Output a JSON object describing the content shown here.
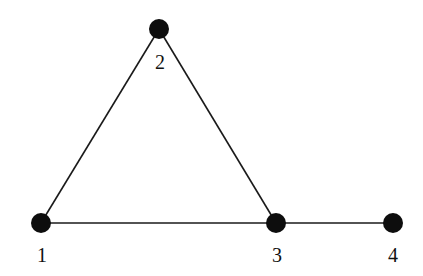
{
  "graph": {
    "nodes": [
      {
        "id": "1",
        "label": "1",
        "x": 41,
        "y": 223,
        "lx": 42,
        "ly": 262
      },
      {
        "id": "2",
        "label": "2",
        "x": 159,
        "y": 29,
        "lx": 160,
        "ly": 69
      },
      {
        "id": "3",
        "label": "3",
        "x": 276,
        "y": 223,
        "lx": 277,
        "ly": 262
      },
      {
        "id": "4",
        "label": "4",
        "x": 393,
        "y": 223,
        "lx": 393,
        "ly": 262
      }
    ],
    "edges": [
      {
        "from": "1",
        "to": "2"
      },
      {
        "from": "2",
        "to": "3"
      },
      {
        "from": "1",
        "to": "3"
      },
      {
        "from": "3",
        "to": "4"
      }
    ],
    "colors": {
      "node": "#0d0d0d",
      "edge": "#1a1a1a",
      "background": "#ffffff"
    }
  }
}
